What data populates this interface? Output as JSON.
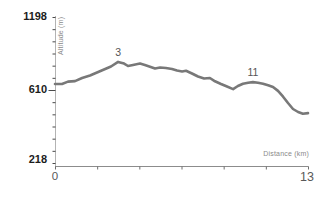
{
  "chart_data": {
    "type": "line",
    "title": "",
    "xlabel": "Distance (km)",
    "ylabel": "Altitude (m)",
    "grid": false,
    "legend": null,
    "line_color": "#787878",
    "axis_color": "#999999",
    "tick_color": "#4a4a4a",
    "x_axis": {
      "min": 0,
      "max": 13,
      "tick_labels": [
        "0",
        "13"
      ],
      "tick_count": 7
    },
    "y_axis": {
      "labels": [
        "1198",
        "610",
        "218"
      ],
      "values": [
        1198,
        610,
        218
      ],
      "minor_tick_count": 13,
      "major_tick_index": 6
    },
    "annotations": [
      {
        "label": "3",
        "km": 3.24,
        "altitude_m": 836
      },
      {
        "label": "11",
        "km": 10.17,
        "altitude_m": 674
      }
    ],
    "profile_km_m": [
      [
        0,
        658
      ],
      [
        0.36,
        658
      ],
      [
        0.67,
        678
      ],
      [
        1.03,
        682
      ],
      [
        1.39,
        707
      ],
      [
        1.8,
        727
      ],
      [
        2.16,
        751
      ],
      [
        2.52,
        775
      ],
      [
        2.88,
        799
      ],
      [
        3.24,
        836
      ],
      [
        3.55,
        823
      ],
      [
        3.75,
        803
      ],
      [
        4.01,
        811
      ],
      [
        4.37,
        823
      ],
      [
        4.62,
        811
      ],
      [
        4.88,
        798
      ],
      [
        5.14,
        783
      ],
      [
        5.4,
        791
      ],
      [
        5.7,
        787
      ],
      [
        6.01,
        779
      ],
      [
        6.27,
        767
      ],
      [
        6.53,
        759
      ],
      [
        6.73,
        765
      ],
      [
        7.04,
        743
      ],
      [
        7.35,
        719
      ],
      [
        7.66,
        703
      ],
      [
        7.96,
        707
      ],
      [
        8.22,
        680
      ],
      [
        8.53,
        658
      ],
      [
        8.84,
        638
      ],
      [
        9.15,
        617
      ],
      [
        9.4,
        642
      ],
      [
        9.66,
        661
      ],
      [
        9.92,
        669
      ],
      [
        10.17,
        674
      ],
      [
        10.43,
        669
      ],
      [
        10.69,
        661
      ],
      [
        10.95,
        648
      ],
      [
        11.2,
        634
      ],
      [
        11.46,
        605
      ],
      [
        11.72,
        574
      ],
      [
        11.97,
        540
      ],
      [
        12.23,
        508
      ],
      [
        12.49,
        492
      ],
      [
        12.74,
        483
      ],
      [
        13,
        486
      ]
    ]
  }
}
